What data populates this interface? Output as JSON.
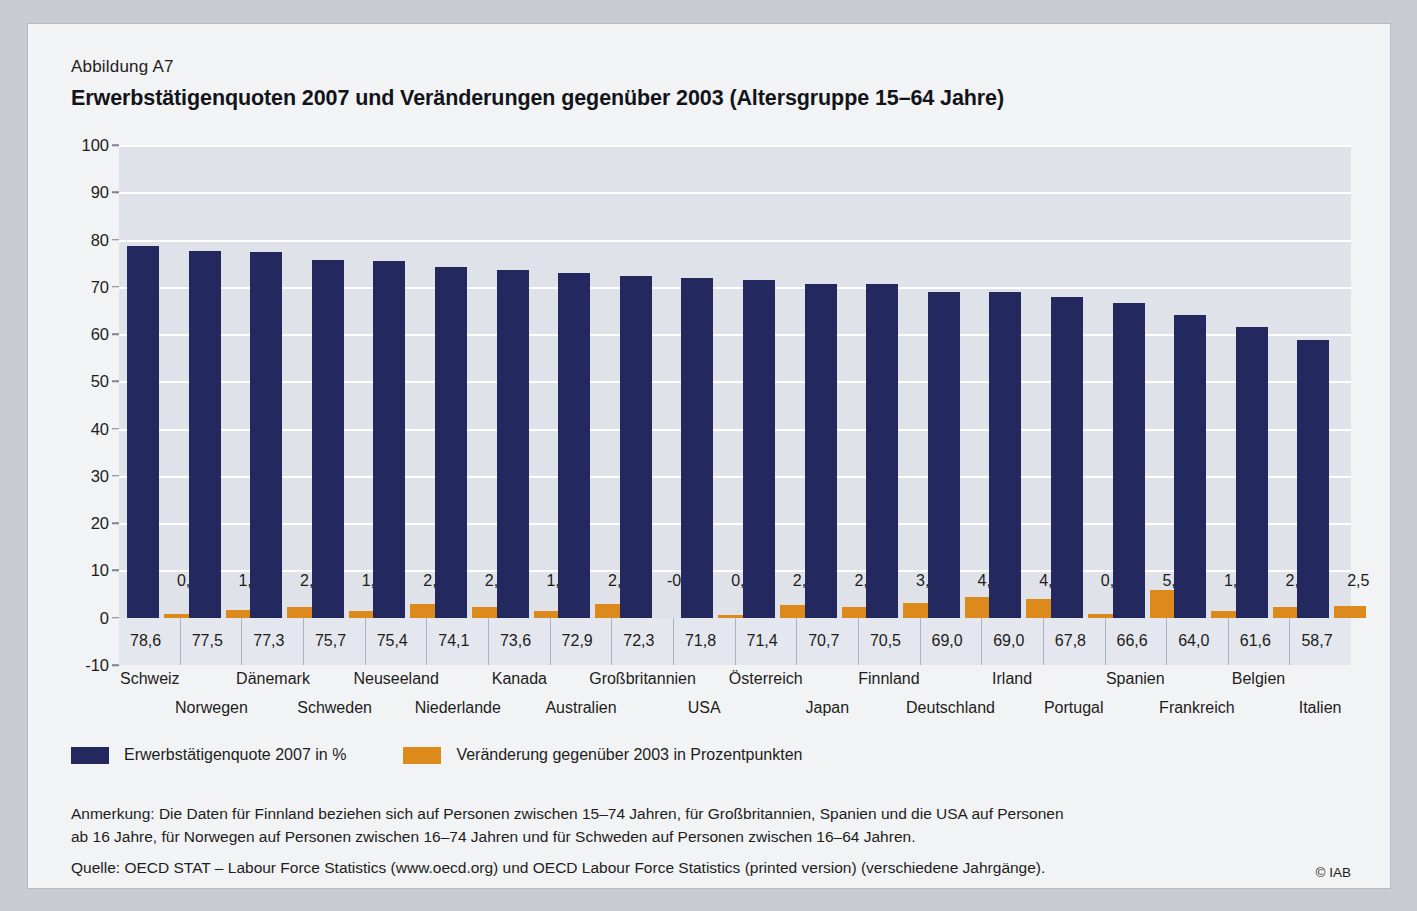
{
  "figure": {
    "number": "Abbildung A7",
    "title": "Erwerbstätigenquoten 2007 und Veränderungen gegenüber 2003 (Altersgruppe 15–64 Jahre)",
    "copyright": "© IAB"
  },
  "legend": {
    "series1_label": "Erwerbstätigenquote 2007 in %",
    "series1_color": "#23295e",
    "series2_label": "Veränderung gegenüber 2003 in Prozentpunkten",
    "series2_color": "#dd8a1c"
  },
  "footer": {
    "note_line1": "Anmerkung: Die Daten für Finnland beziehen sich auf Personen zwischen 15–74 Jahren, für Großbritannien, Spanien und die USA auf Personen",
    "note_line2": "ab 16 Jahre, für Norwegen auf Personen zwischen 16–74 Jahren und für Schweden auf Personen zwischen 16–64 Jahren.",
    "source": "Quelle: OECD STAT – Labour Force Statistics (www.oecd.org) und OECD Labour Force Statistics (printed version) (verschiedene Jahrgänge)."
  },
  "chart_data": {
    "type": "bar",
    "title": "Erwerbstätigenquoten 2007 und Veränderungen gegenüber 2003 (Altersgruppe 15–64 Jahre)",
    "xlabel": "",
    "ylabel": "",
    "ylim": [
      -10,
      100
    ],
    "yticks": [
      100,
      90,
      80,
      70,
      60,
      50,
      40,
      30,
      20,
      10,
      0,
      -10
    ],
    "ytick_labels": [
      "100",
      "90",
      "80",
      "70",
      "60",
      "50",
      "40",
      "30",
      "20",
      "10",
      "0",
      "-10"
    ],
    "grid": true,
    "legend_position": "below",
    "categories": [
      "Schweiz",
      "Norwegen",
      "Dänemark",
      "Schweden",
      "Neuseeland",
      "Niederlande",
      "Kanada",
      "Australien",
      "Großbritannien",
      "USA",
      "Österreich",
      "Japan",
      "Finnland",
      "Deutschland",
      "Irland",
      "Portugal",
      "Spanien",
      "Frankreich",
      "Belgien",
      "Italien"
    ],
    "series": [
      {
        "name": "Erwerbstätigenquote 2007 in %",
        "color": "#23295e",
        "values": [
          78.6,
          77.5,
          77.3,
          75.7,
          75.4,
          74.1,
          73.6,
          72.9,
          72.3,
          71.8,
          71.4,
          70.7,
          70.5,
          69.0,
          69.0,
          67.8,
          66.6,
          64.0,
          61.6,
          58.7
        ],
        "value_labels": [
          "78,6",
          "77,5",
          "77,3",
          "75,7",
          "75,4",
          "74,1",
          "73,6",
          "72,9",
          "72,3",
          "71,8",
          "71,4",
          "70,7",
          "70,5",
          "69,0",
          "69,0",
          "67,8",
          "66,6",
          "64,0",
          "61,6",
          "58,7"
        ]
      },
      {
        "name": "Veränderung gegenüber 2003 in Prozentpunkten",
        "color": "#dd8a1c",
        "values": [
          0.7,
          1.7,
          2.2,
          1.4,
          2.9,
          2.3,
          1.4,
          2.9,
          -0.3,
          0.6,
          2.7,
          2.3,
          3.1,
          4.4,
          4.0,
          0.7,
          5.9,
          1.5,
          2.3,
          2.5
        ],
        "value_labels": [
          "0,7",
          "1,7",
          "2,2",
          "1,4",
          "2,9",
          "2,3",
          "1,4",
          "2,9",
          "-0,3",
          "0,6",
          "2,7",
          "2,3",
          "3,1",
          "4,4",
          "4,0",
          "0,7",
          "5,9",
          "1,5",
          "2,3",
          "2,5"
        ]
      }
    ]
  }
}
